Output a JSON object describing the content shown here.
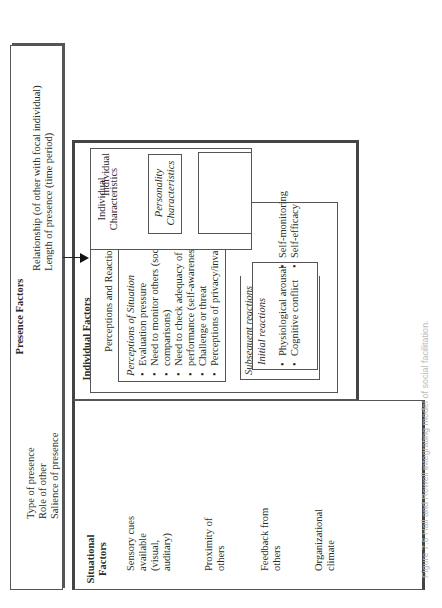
{
  "presence": {
    "title": "Presence Factors",
    "left_items": [
      "Type of presence",
      "Role of other",
      "Salience of presence"
    ],
    "right_items": [
      "Relationship (of other with focal individual)",
      "Length of presence (time period)"
    ]
  },
  "situational": {
    "title_line1": "Situational",
    "title_line2": "Factors",
    "items": [
      [
        "Sensory cues",
        "available",
        "(visual,",
        "auditary)"
      ],
      [
        "Proximity of",
        "others"
      ],
      [
        "Feedback from",
        "others"
      ],
      [
        "Organizational",
        "climate"
      ]
    ]
  },
  "individual": {
    "title": "Individual Factors",
    "perceptions_reactions": {
      "title": "Perceptions and Reactions",
      "perceptions_of_situation": {
        "title": "Perceptions of Situation",
        "items": [
          "Evaluation pressure",
          "Need to monitor others (social",
          "comparisons)",
          "Need to check adequacy of own",
          "performance (self-awareness)",
          "Challenge or threat",
          "Perceptions of privacy/invasion"
        ]
      },
      "subsequent_reactions": {
        "title": "Subsequent reactions"
      },
      "initial_reactions": {
        "title": "Initial reactions",
        "col1": [
          "Physiological arousal",
          "Cognitive conflict"
        ],
        "col2": [
          "Self-monitoring",
          "Self-efficacy"
        ]
      }
    },
    "characteristics": {
      "title_line1": "Individual",
      "title_line2": "Characteristics",
      "personality": {
        "line1": "Personality",
        "line2": "Characteristics"
      },
      "performance_capacity": {
        "line1": "Performance",
        "line2": "Capacity",
        "items": [
          [
            "Task",
            "proficiency"
          ],
          [
            "Intelligence"
          ],
          [
            "Motivation"
          ]
        ]
      }
    }
  },
  "task": {
    "title_line1": "Task",
    "title_line2": "Factors",
    "items": [
      [
        "Difficulty",
        "(simple –",
        "complex)"
      ],
      [
        "Cognitive-",
        "motor",
        "characteristics"
      ],
      [
        "Time",
        "requirements"
      ]
    ]
  },
  "performance": {
    "title": "Performance Factors",
    "items": [
      [
        "Speed"
      ],
      [
        "Accuracy"
      ],
      [
        "Aggressiveness"
      ],
      [
        "Cooperation/",
        "competition"
      ],
      [
        "Other performance"
      ]
    ]
  },
  "caption": "Figure 7.6  Hall and Rowell integrating model of social facilitation."
}
